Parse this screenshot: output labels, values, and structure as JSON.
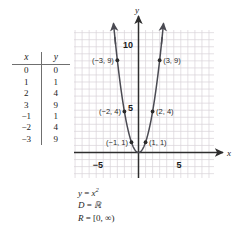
{
  "figure": {
    "type": "graph-with-table",
    "table": {
      "headers": [
        "x",
        "y"
      ],
      "rows": [
        {
          "x": "0",
          "y": "0"
        },
        {
          "x": "1",
          "y": "1"
        },
        {
          "x": "2",
          "y": "4"
        },
        {
          "x": "3",
          "y": "9"
        },
        {
          "x": "−1",
          "y": "1"
        },
        {
          "x": "−2",
          "y": "4"
        },
        {
          "x": "−3",
          "y": "9"
        }
      ]
    },
    "caption": {
      "equation_lhs": "y",
      "equation_eq": " = ",
      "equation_base": "x",
      "equation_exp": "2",
      "domain_label": "D",
      "domain_value": "ℝ",
      "range_label": "R",
      "range_value": " = [0, ∞)"
    },
    "colors": {
      "grid": "#d8d2d8",
      "axis": "#2e2e2e",
      "curve": "#4a4a52",
      "point": "#2a2a2a",
      "text": "#1b1b1b"
    }
  },
  "chart_data": {
    "type": "line",
    "title": "",
    "subtitle": "",
    "xlabel": "x",
    "ylabel": "y",
    "equation": "y = x^2",
    "domain": "D = ℝ",
    "range": "R = [0, ∞)",
    "xlim": [
      -7,
      7
    ],
    "ylim": [
      -2,
      13
    ],
    "xticks": [
      -5,
      5
    ],
    "xticklabels": [
      "−5",
      "5"
    ],
    "yticks": [
      5,
      10
    ],
    "yticklabels": [
      "5",
      "10"
    ],
    "grid": true,
    "legend": "none",
    "arrows": [
      "curve-left-end-up",
      "curve-right-end-up",
      "x-axis-right",
      "y-axis-up"
    ],
    "series": [
      {
        "name": "y = x^2",
        "x": [
          -3,
          -2,
          -1,
          0,
          1,
          2,
          3
        ],
        "values": [
          9,
          4,
          1,
          0,
          1,
          4,
          9
        ]
      }
    ],
    "points": [
      {
        "label": "(−3, 9)",
        "x": -3,
        "y": 9,
        "label_side": "left"
      },
      {
        "label": "(−2, 4)",
        "x": -2,
        "y": 4,
        "label_side": "left"
      },
      {
        "label": "(−1, 1)",
        "x": -1,
        "y": 1,
        "label_side": "left"
      },
      {
        "label": "(1, 1)",
        "x": 1,
        "y": 1,
        "label_side": "right"
      },
      {
        "label": "(2, 4)",
        "x": 2,
        "y": 4,
        "label_side": "right"
      },
      {
        "label": "(3, 9)",
        "x": 3,
        "y": 9,
        "label_side": "right"
      }
    ]
  }
}
